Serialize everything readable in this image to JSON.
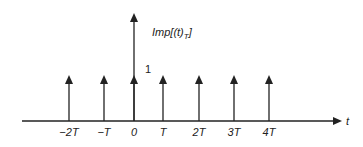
{
  "diagram": {
    "function_label": "Imp[(t) T]",
    "function_label_main": "Imp[(t)",
    "function_label_sub": "T",
    "function_label_close": "]",
    "amplitude_label": "1",
    "axis_label": "t",
    "colors": {
      "line": "#222222",
      "background": "#ffffff"
    },
    "impulses": [
      {
        "label": "−2T",
        "x": 69
      },
      {
        "label": "−T",
        "x": 104
      },
      {
        "label": "0",
        "x": 134
      },
      {
        "label": "T",
        "x": 163
      },
      {
        "label": "2T",
        "x": 199
      },
      {
        "label": "3T",
        "x": 234
      },
      {
        "label": "4T",
        "x": 269
      }
    ]
  }
}
